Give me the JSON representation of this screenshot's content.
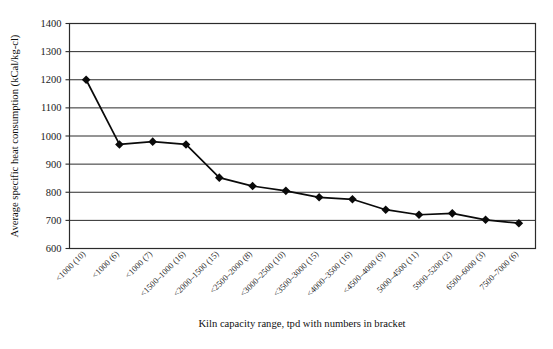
{
  "chart_data": {
    "type": "line",
    "title": "",
    "xlabel": "Kiln capacity range, tpd with numbers in bracket",
    "ylabel": "Average specific heat consumption (kCal/kg-cl)",
    "categories": [
      "<1000 (10)",
      "<1000 (6)",
      "<1000 (7)",
      "<1500–1000 (16)",
      "<2000–1500 (15)",
      "<2500–2000 (8)",
      "<3000–2500 (10)",
      "<3500–3000 (15)",
      "<4000–3500 (16)",
      "<4500–4000 (9)",
      "5000–4500 (11)",
      "5900–5200 (2)",
      "6500–6000 (3)",
      "7500–7000 (6)"
    ],
    "values": [
      1200,
      970,
      980,
      970,
      852,
      822,
      805,
      782,
      775,
      738,
      720,
      725,
      702,
      690
    ],
    "series": [
      {
        "name": "Average specific heat consumption",
        "values": [
          1200,
          970,
          980,
          970,
          852,
          822,
          805,
          782,
          775,
          738,
          720,
          725,
          702,
          690
        ]
      }
    ],
    "ylim": [
      600,
      1400
    ],
    "ytick_step": 100,
    "yticks": [
      600,
      700,
      800,
      900,
      1000,
      1100,
      1200,
      1300,
      1400
    ],
    "grid": true,
    "legend": false,
    "marker": "diamond",
    "line_color": "#0a0a0a",
    "grid_color": "#2b2b2b",
    "background": "#ffffff"
  }
}
